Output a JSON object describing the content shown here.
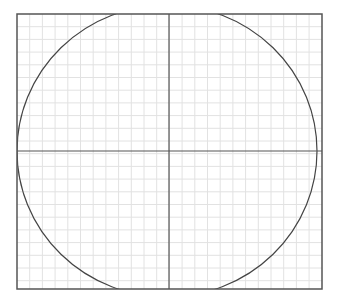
{
  "diagram": {
    "type": "circle-on-grid",
    "frame": {
      "x": 17,
      "y": 14,
      "width": 305,
      "height": 275,
      "stroke": "#555555"
    },
    "grid": {
      "spacing": 12.7,
      "color": "#e2e2e2"
    },
    "axes": {
      "cx": 169,
      "cy": 151,
      "color": "#555555"
    },
    "circle": {
      "cx": 167,
      "cy": 151,
      "rx": 150,
      "ry": 146,
      "stroke": "#444444"
    }
  }
}
